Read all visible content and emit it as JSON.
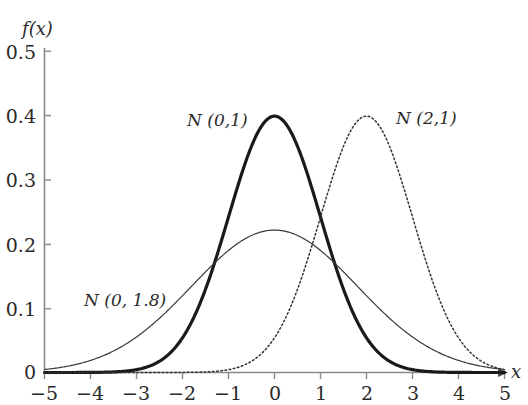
{
  "figure": {
    "background_color": "#ffffff",
    "axis_color": "#8a8a8a",
    "text_color": "#2a2a2a"
  },
  "axes": {
    "x_axis_title": "x",
    "y_axis_title": "f(x)",
    "x_ticks": [
      "−5",
      "−4",
      "−3",
      "−2",
      "−1",
      "0",
      "1",
      "2",
      "3",
      "4",
      "5"
    ],
    "y_ticks": [
      "0",
      "0.1",
      "0.2",
      "0.3",
      "0.4",
      "0.5"
    ]
  },
  "curve_labels": {
    "standard_normal": "N (0,1)",
    "shifted_normal": "N (2,1)",
    "wide_normal": "N (0, 1.8)"
  },
  "chart_data": {
    "type": "line",
    "title": "",
    "subtitle": "",
    "xlabel": "x",
    "ylabel": "f(x)",
    "xlim": [
      -5,
      5
    ],
    "ylim": [
      0,
      0.5
    ],
    "xticks": [
      -5,
      -4,
      -3,
      -2,
      -1,
      0,
      1,
      2,
      3,
      4,
      5
    ],
    "yticks": [
      0,
      0.1,
      0.2,
      0.3,
      0.4,
      0.5
    ],
    "grid": false,
    "legend_position": "inline-annotations",
    "series": [
      {
        "name": "N (0,1)",
        "mean": 0,
        "sigma": 1,
        "peak_value": 0.399,
        "peak_x": 0,
        "style": "solid",
        "line_width": 3.2,
        "color": "#1a1a1a",
        "label_position": {
          "x": -1.2,
          "y": 0.432
        },
        "x": [
          -5,
          -4.5,
          -4,
          -3.5,
          -3,
          -2.5,
          -2,
          -1.5,
          -1,
          -0.5,
          0,
          0.5,
          1,
          1.5,
          2,
          2.5,
          3,
          3.5,
          4,
          4.5,
          5
        ],
        "values": [
          1.5e-06,
          1.6e-05,
          0.0001338,
          0.0008727,
          0.0044318,
          0.0175283,
          0.053991,
          0.1295176,
          0.2419707,
          0.3520653,
          0.3989423,
          0.3520653,
          0.2419707,
          0.1295176,
          0.053991,
          0.0175283,
          0.0044318,
          0.0008727,
          0.0001338,
          1.6e-05,
          1.5e-06
        ]
      },
      {
        "name": "N (2,1)",
        "mean": 2,
        "sigma": 1,
        "peak_value": 0.399,
        "peak_x": 2,
        "style": "dotted",
        "line_width": 1.5,
        "color": "#333333",
        "label_position": {
          "x": 3.0,
          "y": 0.428
        },
        "x": [
          -5,
          -4.5,
          -4,
          -3.5,
          -3,
          -2.5,
          -2,
          -1.5,
          -1,
          -0.5,
          0,
          0.5,
          1,
          1.5,
          2,
          2.5,
          3,
          3.5,
          4,
          4.5,
          5
        ],
        "values": [
          0.0,
          0.0,
          0.0,
          0.0,
          1.5e-06,
          1.6e-05,
          0.0001338,
          0.0008727,
          0.0044318,
          0.0175283,
          0.053991,
          0.1295176,
          0.2419707,
          0.3520653,
          0.3989423,
          0.3520653,
          0.2419707,
          0.1295176,
          0.053991,
          0.0175283,
          0.0044318
        ]
      },
      {
        "name": "N (0, 1.8)",
        "mean": 0,
        "sigma": 1.8,
        "peak_value": 0.222,
        "peak_x": 0,
        "style": "solid",
        "line_width": 1.2,
        "color": "#3a3a3a",
        "label_position": {
          "x": -3.9,
          "y": 0.118
        },
        "x": [
          -5,
          -4.5,
          -4,
          -3.5,
          -3,
          -2.5,
          -2,
          -1.5,
          -1,
          -0.5,
          0,
          0.5,
          1,
          1.5,
          2,
          2.5,
          3,
          3.5,
          4,
          4.5,
          5
        ],
        "values": [
          0.0046774,
          0.0095166,
          0.017487,
          0.0289937,
          0.0434783,
          0.059057,
          0.072797,
          0.0816742,
          0.083655,
          0.078345,
          0.0775,
          0.078345,
          0.083655,
          0.0816742,
          0.072797,
          0.059057,
          0.0434783,
          0.0289937,
          0.017487,
          0.0095166,
          0.0046774
        ]
      }
    ]
  }
}
